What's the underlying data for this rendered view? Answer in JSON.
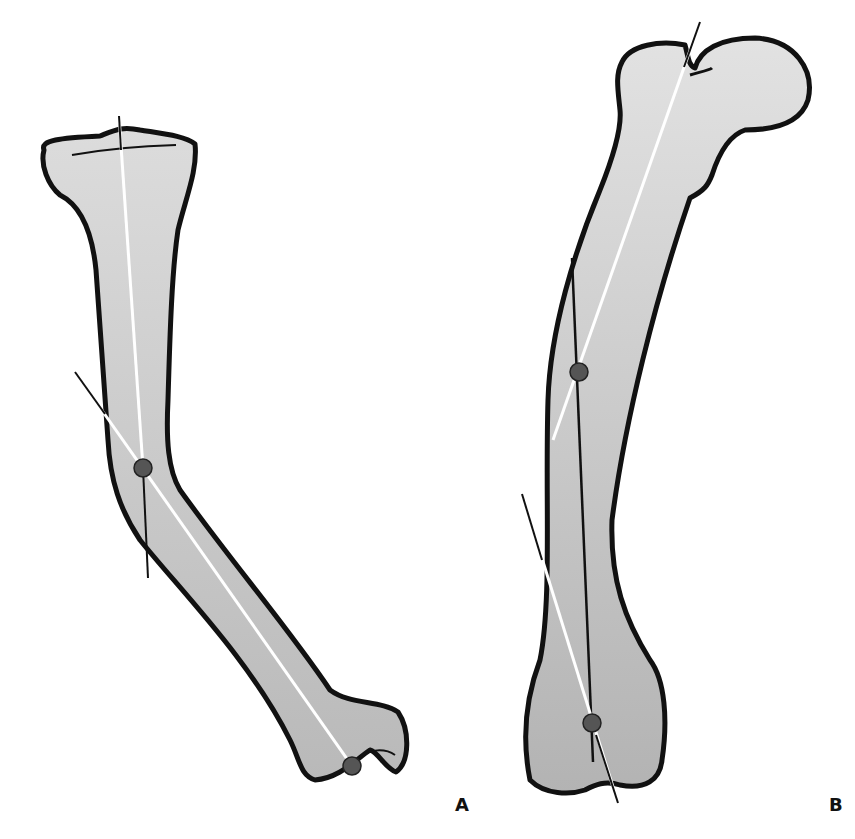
{
  "figure": {
    "panels": [
      {
        "id": "A",
        "label": "A",
        "description": "Curved bone with proximal and distal axis lines crossing at a center of rotation (dot), distal pivot dot"
      },
      {
        "id": "B",
        "label": "B",
        "description": "Curved femur with proximal and distal anatomic axis lines crossing at a center of rotation (dot), distal dot at condyles"
      }
    ]
  },
  "colors": {
    "bone_fill_light": "#d9d9d9",
    "bone_fill_dark": "#b5b5b5",
    "outline": "#111111",
    "axis_white": "#ffffff",
    "axis_dark": "#111111",
    "dot": "#555555"
  }
}
